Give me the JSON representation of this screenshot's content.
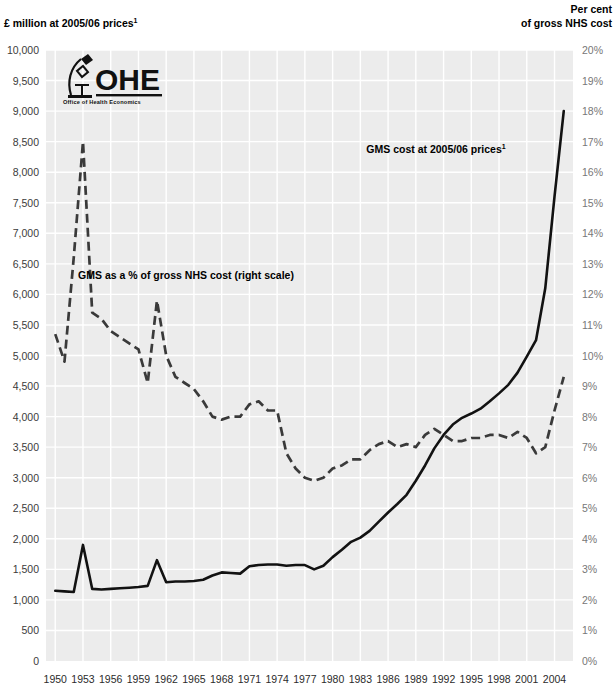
{
  "chart_data": {
    "type": "line",
    "title": "",
    "ylabel": "£ million at 2005/06 prices",
    "ylabel_sup": "1",
    "ylabel_right_line1": "Per cent",
    "ylabel_right_line2": "of gross NHS cost",
    "xlabel": "",
    "ylim": [
      0,
      10000
    ],
    "ylim_right": [
      0,
      20
    ],
    "ytick_step": 500,
    "ytick_labels": [
      "10,000",
      "9,500",
      "9,000",
      "8,500",
      "8,000",
      "7,500",
      "7,000",
      "6,500",
      "6,000",
      "5,500",
      "5,000",
      "4,500",
      "4,000",
      "3,500",
      "3,000",
      "2,500",
      "2,000",
      "1,500",
      "1,000",
      "500",
      "0"
    ],
    "ytick_values": [
      10000,
      9500,
      9000,
      8500,
      8000,
      7500,
      7000,
      6500,
      6000,
      5500,
      5000,
      4500,
      4000,
      3500,
      3000,
      2500,
      2000,
      1500,
      1000,
      500,
      0
    ],
    "ytick_labels_right": [
      "20%",
      "19%",
      "18%",
      "17%",
      "16%",
      "15%",
      "14%",
      "13%",
      "12%",
      "11%",
      "10%",
      "9%",
      "8%",
      "7%",
      "6%",
      "5%",
      "4%",
      "3%",
      "2%",
      "1%",
      "0%"
    ],
    "ytick_values_right": [
      20,
      19,
      18,
      17,
      16,
      15,
      14,
      13,
      12,
      11,
      10,
      9,
      8,
      7,
      6,
      5,
      4,
      3,
      2,
      1,
      0
    ],
    "xlim": [
      1949,
      2006
    ],
    "xtick_labels": [
      "1950",
      "1953",
      "1956",
      "1959",
      "1962",
      "1965",
      "1968",
      "1971",
      "1974",
      "1977",
      "1980",
      "1983",
      "1986",
      "1989",
      "1992",
      "1995",
      "1998",
      "2001",
      "2004"
    ],
    "xtick_values": [
      1950,
      1953,
      1956,
      1959,
      1962,
      1965,
      1968,
      1971,
      1974,
      1977,
      1980,
      1983,
      1986,
      1989,
      1992,
      1995,
      1998,
      2001,
      2004
    ],
    "grid": true,
    "legend_position": "inline-annotations",
    "annotations": [
      {
        "name": "solid-series-label",
        "text": "GMS cost at 2005/06 prices",
        "sup": "1",
        "x": 436,
        "y": 153
      },
      {
        "name": "dashed-series-label",
        "text": "GMS as a % of gross NHS cost (right scale)",
        "sup": "",
        "x": 186,
        "y": 279
      }
    ],
    "series": [
      {
        "name": "GMS cost at 2005/06 prices",
        "axis": "left",
        "style": "solid",
        "color": "#121212",
        "unit": "£ million at 2005/06 prices",
        "x": [
          1950,
          1951,
          1952,
          1953,
          1954,
          1955,
          1956,
          1957,
          1958,
          1959,
          1960,
          1961,
          1962,
          1963,
          1964,
          1965,
          1966,
          1967,
          1968,
          1969,
          1970,
          1971,
          1972,
          1973,
          1974,
          1975,
          1976,
          1977,
          1978,
          1979,
          1980,
          1981,
          1982,
          1983,
          1984,
          1985,
          1986,
          1987,
          1988,
          1989,
          1990,
          1991,
          1992,
          1993,
          1994,
          1995,
          1996,
          1997,
          1998,
          1999,
          2000,
          2001,
          2002,
          2003,
          2004,
          2005
        ],
        "values": [
          1150,
          1140,
          1130,
          1900,
          1180,
          1170,
          1180,
          1190,
          1200,
          1210,
          1230,
          1650,
          1290,
          1300,
          1300,
          1310,
          1330,
          1400,
          1450,
          1440,
          1430,
          1550,
          1570,
          1580,
          1580,
          1560,
          1570,
          1570,
          1500,
          1560,
          1700,
          1820,
          1950,
          2020,
          2130,
          2280,
          2430,
          2570,
          2720,
          2950,
          3200,
          3480,
          3700,
          3870,
          3980,
          4050,
          4130,
          4250,
          4380,
          4520,
          4720,
          4980,
          5250,
          6100,
          7600,
          9000
        ]
      },
      {
        "name": "GMS as a % of gross NHS cost",
        "axis": "right",
        "style": "dashed",
        "color": "#3a3a3a",
        "unit": "per cent of gross NHS cost",
        "x": [
          1950,
          1951,
          1952,
          1953,
          1954,
          1955,
          1956,
          1957,
          1958,
          1959,
          1960,
          1961,
          1962,
          1963,
          1964,
          1965,
          1966,
          1967,
          1968,
          1969,
          1970,
          1971,
          1972,
          1973,
          1974,
          1975,
          1976,
          1977,
          1978,
          1979,
          1980,
          1981,
          1982,
          1983,
          1984,
          1985,
          1986,
          1987,
          1988,
          1989,
          1990,
          1991,
          1992,
          1993,
          1994,
          1995,
          1996,
          1997,
          1998,
          1999,
          2000,
          2001,
          2002,
          2003,
          2004,
          2005
        ],
        "values": [
          10.7,
          9.8,
          13.2,
          17.0,
          11.4,
          11.2,
          10.8,
          10.6,
          10.4,
          10.2,
          9.1,
          11.8,
          10.0,
          9.3,
          9.1,
          8.9,
          8.5,
          8.0,
          7.9,
          8.0,
          8.0,
          8.4,
          8.5,
          8.2,
          8.2,
          6.8,
          6.3,
          6.0,
          5.9,
          6.0,
          6.3,
          6.4,
          6.6,
          6.6,
          6.9,
          7.1,
          7.2,
          7.0,
          7.1,
          7.0,
          7.4,
          7.6,
          7.4,
          7.2,
          7.2,
          7.3,
          7.3,
          7.4,
          7.4,
          7.3,
          7.5,
          7.3,
          6.8,
          7.0,
          8.2,
          9.3
        ]
      }
    ]
  },
  "branding": {
    "logo_word": "OHE",
    "logo_tagline": "Office of Health Economics",
    "logo_icon": "microscope-icon"
  }
}
